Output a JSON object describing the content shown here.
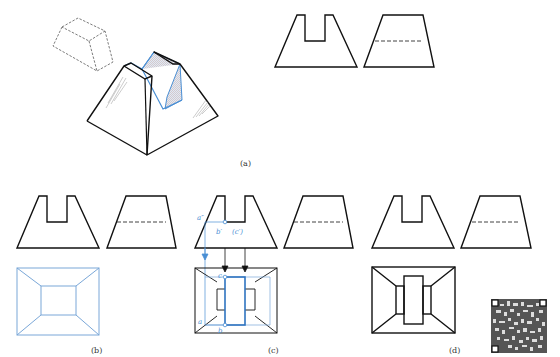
{
  "figure": {
    "colors": {
      "outline": "#111111",
      "construction": "#4a8fd4",
      "hidden_line": "#333333",
      "hatch": "#4a8fd4"
    },
    "panels": [
      {
        "id": "a",
        "label": "(a)",
        "content": "isometric view of slotted frustum with removed prism block, plus front and side views"
      },
      {
        "id": "b",
        "label": "(b)",
        "content": "front view, side view and top view of the un-slotted frustum"
      },
      {
        "id": "c",
        "label": "(c)",
        "content": "projection of slot points onto top view"
      },
      {
        "id": "d",
        "label": "(d)",
        "content": "completed three views"
      }
    ],
    "point_labels": {
      "a_double_prime": "a″",
      "b_prime": "b′",
      "c_prime_hidden": "(c′)",
      "c": "c",
      "a": "a",
      "b": "b"
    },
    "qr_code": "qr-code-icon"
  }
}
